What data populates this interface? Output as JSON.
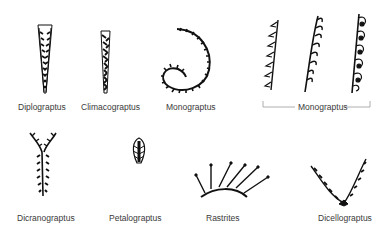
{
  "specimens": [
    {
      "id": "diplograptus",
      "label": "Diplograptus"
    },
    {
      "id": "climacograptus",
      "label": "Climacograptus"
    },
    {
      "id": "monograptus-spiral",
      "label": "Monograptus"
    },
    {
      "id": "monograptus-group",
      "label": "Monograptus",
      "count": 3
    },
    {
      "id": "dicranograptus",
      "label": "Dicranograptus"
    },
    {
      "id": "petalograptus",
      "label": "Petalograptus"
    },
    {
      "id": "rastrites",
      "label": "Rastrites"
    },
    {
      "id": "dicellograptus",
      "label": "Dicellograptus"
    }
  ],
  "colors": {
    "ink": "#111111",
    "label": "#3a3a3a",
    "background": "#ffffff",
    "bracket": "#9a9a9a"
  }
}
